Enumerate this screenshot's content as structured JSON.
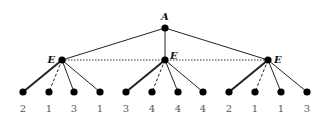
{
  "diagram": {
    "type": "game-tree",
    "root": {
      "label": "A",
      "x": 165,
      "y": 28
    },
    "info_set": {
      "style": "dotted",
      "from_x": 62,
      "to_x": 268,
      "y": 60
    },
    "children": [
      {
        "label": "E",
        "x": 62,
        "y": 60,
        "label_side": "left",
        "leaves": [
          {
            "x": 23,
            "value": "2",
            "edge": "thick"
          },
          {
            "x": 49,
            "value": "1",
            "edge": "dashed"
          },
          {
            "x": 74,
            "value": "3",
            "edge": "thin"
          },
          {
            "x": 100,
            "value": "1",
            "edge": "thin"
          }
        ]
      },
      {
        "label": "E",
        "x": 165,
        "y": 60,
        "label_side": "right-up",
        "leaves": [
          {
            "x": 126,
            "value": "3",
            "edge": "thick"
          },
          {
            "x": 152,
            "value": "4",
            "edge": "dashed"
          },
          {
            "x": 178,
            "value": "4",
            "edge": "thin"
          },
          {
            "x": 203,
            "value": "4",
            "edge": "thin"
          }
        ]
      },
      {
        "label": "E",
        "x": 268,
        "y": 60,
        "label_side": "right",
        "leaves": [
          {
            "x": 229,
            "value": "2",
            "edge": "thick"
          },
          {
            "x": 255,
            "value": "1",
            "edge": "dashed"
          },
          {
            "x": 281,
            "value": "1",
            "edge": "thin"
          },
          {
            "x": 307,
            "value": "3",
            "edge": "thin"
          }
        ]
      }
    ],
    "leaf_y": 92,
    "leaf_label_y": 112
  }
}
